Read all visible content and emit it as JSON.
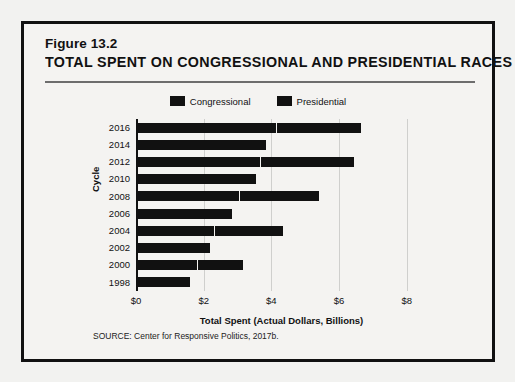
{
  "figure": {
    "number": "Figure 13.2",
    "title": "TOTAL SPENT ON CONGRESSIONAL AND PRESIDENTIAL RACES",
    "source": "SOURCE: Center for Responsive Politics, 2017b."
  },
  "legend": [
    {
      "label": "Congressional",
      "color": "#111111",
      "swatch_name": "legend-swatch-congressional"
    },
    {
      "label": "Presidential",
      "color": "#111111",
      "swatch_name": "legend-swatch-presidential"
    }
  ],
  "axes": {
    "x_ticks": [
      "$0",
      "$2",
      "$4",
      "$6",
      "$8"
    ],
    "x_tick_values": [
      0,
      2,
      4,
      6,
      8
    ],
    "x_title": "Total Spent (Actual Dollars, Billions)",
    "y_title": "Cycle"
  },
  "chart_data": {
    "type": "bar",
    "orientation": "horizontal",
    "stacked": true,
    "title": "TOTAL SPENT ON CONGRESSIONAL AND PRESIDENTIAL RACES",
    "subtitle": "Figure 13.2",
    "xlabel": "Total Spent (Actual Dollars, Billions)",
    "ylabel": "Cycle",
    "xlim": [
      0,
      8.6
    ],
    "xticks": [
      0,
      2,
      4,
      6,
      8
    ],
    "grid": "vertical",
    "legend_position": "top-center",
    "categories": [
      "2016",
      "2014",
      "2012",
      "2010",
      "2008",
      "2006",
      "2004",
      "2002",
      "2000",
      "1998"
    ],
    "series": [
      {
        "name": "Congressional",
        "values": [
          4.15,
          3.85,
          3.65,
          3.55,
          3.05,
          2.85,
          2.3,
          2.2,
          1.8,
          1.6
        ]
      },
      {
        "name": "Presidential",
        "values": [
          2.5,
          0.0,
          2.8,
          0.0,
          2.35,
          0.0,
          2.05,
          0.0,
          1.35,
          0.0
        ]
      }
    ],
    "totals": [
      6.65,
      3.85,
      6.45,
      3.55,
      5.4,
      2.85,
      4.35,
      2.2,
      3.15,
      1.6
    ]
  }
}
